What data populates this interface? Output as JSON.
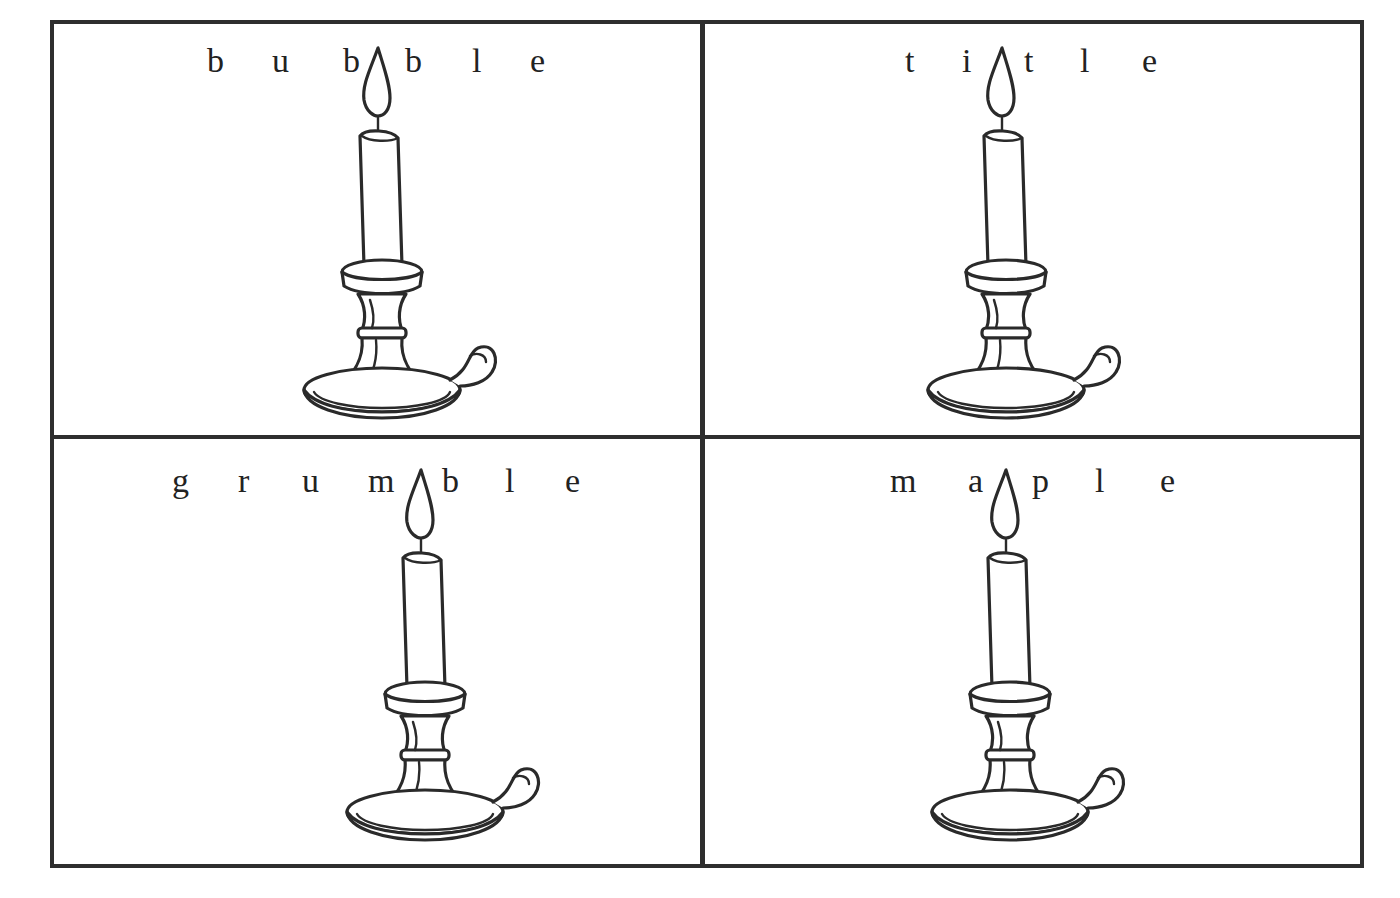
{
  "worksheet": {
    "cards": [
      {
        "id": "bubble",
        "word": "bubble",
        "letters": [
          "b",
          "u",
          "b",
          "b",
          "l",
          "e"
        ],
        "letter_x": [
          207,
          272,
          343,
          405,
          472,
          530
        ],
        "flame_after_index": 2,
        "candle_x": 300,
        "candle_y": 40
      },
      {
        "id": "title",
        "word": "title",
        "letters": [
          "t",
          "i",
          "t",
          "l",
          "e"
        ],
        "letter_x": [
          905,
          962,
          1024,
          1080,
          1142
        ],
        "flame_after_index": 1,
        "candle_x": 924,
        "candle_y": 40
      },
      {
        "id": "grumble",
        "word": "grumble",
        "letters": [
          "g",
          "r",
          "u",
          "m",
          "b",
          "l",
          "e"
        ],
        "letter_x": [
          172,
          238,
          302,
          368,
          442,
          505,
          565
        ],
        "flame_after_index": 3,
        "candle_x": 343,
        "candle_y": 462
      },
      {
        "id": "maple",
        "word": "maple",
        "letters": [
          "m",
          "a",
          "p",
          "l",
          "e"
        ],
        "letter_x": [
          890,
          968,
          1032,
          1095,
          1160
        ],
        "flame_after_index": 1,
        "candle_x": 928,
        "candle_y": 462
      }
    ],
    "colors": {
      "line": "#2e2e2e",
      "ink": "#222222",
      "paper": "#ffffff"
    }
  }
}
